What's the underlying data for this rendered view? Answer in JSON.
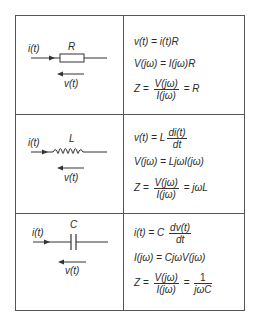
{
  "rows": [
    {
      "component": "resistor",
      "symbol_label": "R",
      "current_label": "i(t)",
      "voltage_label": "v(t)",
      "equations": {
        "time_domain": {
          "lhs": "v(t)",
          "eq": "=",
          "rhs": "i(t)R"
        },
        "phasor": {
          "lhs": "V(jω)",
          "eq": "=",
          "rhs": "I(jω)R"
        },
        "impedance": {
          "lhs": "Z",
          "eq": "=",
          "num": "V(jω)",
          "den": "I(jω)",
          "eq2": "=",
          "result": "R"
        }
      }
    },
    {
      "component": "inductor",
      "symbol_label": "L",
      "current_label": "i(t)",
      "voltage_label": "v(t)",
      "equations": {
        "time_domain": {
          "lhs": "v(t)",
          "eq": "=",
          "coef": "L",
          "num": "di(t)",
          "den": "dt"
        },
        "phasor": {
          "lhs": "V(jω)",
          "eq": "=",
          "rhs": "LjωI(jω)"
        },
        "impedance": {
          "lhs": "Z",
          "eq": "=",
          "num": "V(jω)",
          "den": "I(jω)",
          "eq2": "=",
          "result": "jωL"
        }
      }
    },
    {
      "component": "capacitor",
      "symbol_label": "C",
      "current_label": "i(t)",
      "voltage_label": "v(t)",
      "equations": {
        "time_domain": {
          "lhs": "i(t)",
          "eq": "=",
          "coef": "C",
          "num": "dv(t)",
          "den": "dt"
        },
        "phasor": {
          "lhs": "I(jω)",
          "eq": "=",
          "rhs": "CjωV(jω)"
        },
        "impedance": {
          "lhs": "Z",
          "eq": "=",
          "num": "V(jω)",
          "den": "I(jω)",
          "eq2": "=",
          "num2": "1",
          "den2": "jωC"
        }
      }
    }
  ]
}
